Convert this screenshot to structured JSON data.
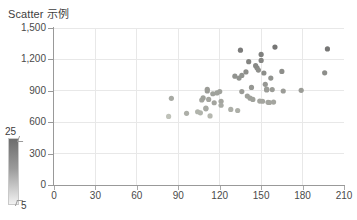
{
  "chart_data": {
    "type": "scatter",
    "title": "Scatter 示例",
    "xlabel": "",
    "ylabel": "",
    "xlim": [
      0,
      210
    ],
    "ylim": [
      0,
      1500
    ],
    "grid": true,
    "xticks": [
      "0",
      "30",
      "60",
      "90",
      "120",
      "150",
      "180",
      "210"
    ],
    "xtick_values": [
      0,
      30,
      60,
      90,
      120,
      150,
      180,
      210
    ],
    "yticks": [
      "0",
      "300",
      "600",
      "900",
      "1,200",
      "1,500"
    ],
    "ytick_values": [
      0,
      300,
      600,
      900,
      1200,
      1500
    ],
    "marker_color": "#8f9487",
    "marker_size": 3,
    "points": [
      {
        "x": 83,
        "y": 655,
        "c": 7
      },
      {
        "x": 85,
        "y": 828,
        "c": 12
      },
      {
        "x": 96,
        "y": 685,
        "c": 11
      },
      {
        "x": 104,
        "y": 700,
        "c": 10
      },
      {
        "x": 106,
        "y": 690,
        "c": 10
      },
      {
        "x": 107,
        "y": 812,
        "c": 13
      },
      {
        "x": 108,
        "y": 832,
        "c": 14
      },
      {
        "x": 110,
        "y": 728,
        "c": 12
      },
      {
        "x": 110,
        "y": 735,
        "c": 12
      },
      {
        "x": 111,
        "y": 915,
        "c": 15
      },
      {
        "x": 111,
        "y": 898,
        "c": 15
      },
      {
        "x": 112,
        "y": 818,
        "c": 13
      },
      {
        "x": 113,
        "y": 660,
        "c": 9
      },
      {
        "x": 115,
        "y": 872,
        "c": 14
      },
      {
        "x": 116,
        "y": 786,
        "c": 13
      },
      {
        "x": 118,
        "y": 880,
        "c": 14
      },
      {
        "x": 120,
        "y": 893,
        "c": 14
      },
      {
        "x": 121,
        "y": 800,
        "c": 13
      },
      {
        "x": 121,
        "y": 762,
        "c": 12
      },
      {
        "x": 128,
        "y": 722,
        "c": 11
      },
      {
        "x": 131,
        "y": 1040,
        "c": 17
      },
      {
        "x": 133,
        "y": 712,
        "c": 11
      },
      {
        "x": 134,
        "y": 1022,
        "c": 17
      },
      {
        "x": 135,
        "y": 1288,
        "c": 22
      },
      {
        "x": 136,
        "y": 1047,
        "c": 17
      },
      {
        "x": 136,
        "y": 893,
        "c": 15
      },
      {
        "x": 139,
        "y": 1080,
        "c": 18
      },
      {
        "x": 140,
        "y": 850,
        "c": 14
      },
      {
        "x": 141,
        "y": 1178,
        "c": 20
      },
      {
        "x": 142,
        "y": 830,
        "c": 14
      },
      {
        "x": 143,
        "y": 932,
        "c": 16
      },
      {
        "x": 144,
        "y": 818,
        "c": 14
      },
      {
        "x": 146,
        "y": 1140,
        "c": 19
      },
      {
        "x": 147,
        "y": 1120,
        "c": 19
      },
      {
        "x": 148,
        "y": 1098,
        "c": 18
      },
      {
        "x": 149,
        "y": 802,
        "c": 13
      },
      {
        "x": 150,
        "y": 1248,
        "c": 21
      },
      {
        "x": 150,
        "y": 1190,
        "c": 20
      },
      {
        "x": 151,
        "y": 800,
        "c": 13
      },
      {
        "x": 152,
        "y": 1070,
        "c": 18
      },
      {
        "x": 153,
        "y": 962,
        "c": 16
      },
      {
        "x": 154,
        "y": 916,
        "c": 15
      },
      {
        "x": 154,
        "y": 908,
        "c": 15
      },
      {
        "x": 155,
        "y": 790,
        "c": 13
      },
      {
        "x": 156,
        "y": 788,
        "c": 13
      },
      {
        "x": 157,
        "y": 1022,
        "c": 17
      },
      {
        "x": 158,
        "y": 912,
        "c": 15
      },
      {
        "x": 159,
        "y": 792,
        "c": 13
      },
      {
        "x": 160,
        "y": 1318,
        "c": 23
      },
      {
        "x": 165,
        "y": 1085,
        "c": 18
      },
      {
        "x": 166,
        "y": 898,
        "c": 15
      },
      {
        "x": 179,
        "y": 905,
        "c": 15
      },
      {
        "x": 196,
        "y": 1072,
        "c": 18
      },
      {
        "x": 198,
        "y": 1300,
        "c": 23
      }
    ],
    "colorbar": {
      "max_label": "25",
      "min_label": "5",
      "max_value": 25,
      "min_value": 5,
      "color_top": "#6d6d6d",
      "color_bottom": "#f2f2f2"
    },
    "colors": {
      "grid": "#e8e8e8",
      "axis": "#999999",
      "text": "#4a4a4a",
      "title": "#404040",
      "background": "#ffffff"
    }
  }
}
